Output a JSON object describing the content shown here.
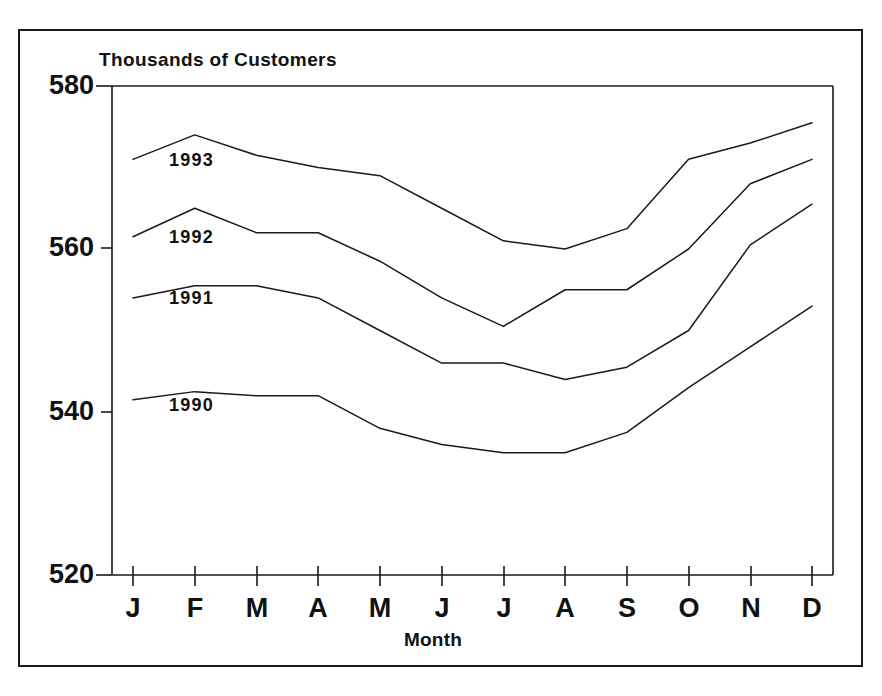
{
  "chart_data": {
    "type": "line",
    "title": "",
    "xlabel": "Month",
    "ylabel": "Thousands of Customers",
    "categories": [
      "J",
      "F",
      "M",
      "A",
      "M",
      "J",
      "J",
      "A",
      "S",
      "O",
      "N",
      "D"
    ],
    "ylim": [
      520,
      580
    ],
    "yticks": [
      520,
      540,
      560,
      580
    ],
    "ytick_labels": [
      "520",
      "540",
      "560",
      "580"
    ],
    "grid": false,
    "legend": "inline-series-labels",
    "series": [
      {
        "name": "1993",
        "values": [
          571,
          574,
          571.5,
          570,
          569,
          565,
          561,
          560,
          562.5,
          571,
          573,
          575.5
        ]
      },
      {
        "name": "1992",
        "values": [
          561.5,
          565,
          562,
          562,
          558.5,
          554,
          550.5,
          555,
          555,
          560,
          568,
          571
        ]
      },
      {
        "name": "1991",
        "values": [
          554,
          555.5,
          555.5,
          554,
          550,
          546,
          546,
          544,
          545.5,
          550,
          560.5,
          565.5
        ]
      },
      {
        "name": "1990",
        "values": [
          541.5,
          542.5,
          542,
          542,
          538,
          536,
          535,
          535,
          537.5,
          543,
          548,
          553
        ]
      }
    ]
  },
  "axis": {
    "y_title": "Thousands of Customers",
    "x_title": "Month",
    "y_tick_0": "520",
    "y_tick_1": "540",
    "y_tick_2": "560",
    "y_tick_3": "580",
    "x_tick_0": "J",
    "x_tick_1": "F",
    "x_tick_2": "M",
    "x_tick_3": "A",
    "x_tick_4": "M",
    "x_tick_5": "J",
    "x_tick_6": "J",
    "x_tick_7": "A",
    "x_tick_8": "S",
    "x_tick_9": "O",
    "x_tick_10": "N",
    "x_tick_11": "D"
  },
  "series_labels": {
    "label_1993": "1993",
    "label_1992": "1992",
    "label_1991": "1991",
    "label_1990": "1990"
  },
  "colors": {
    "ink": "#1a1a1a",
    "background": "#ffffff"
  }
}
